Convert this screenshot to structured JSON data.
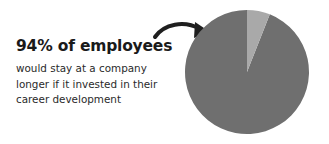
{
  "headline": "94% of employees",
  "body_lines": [
    "would stay at a company",
    "longer if it invested in their",
    "career development"
  ],
  "colors": {
    "major_slice": "#6f6f6f",
    "minor_slice": "#a9a9a9",
    "arrow": "#1f1f1f"
  },
  "chart_data": {
    "type": "pie",
    "title": "",
    "categories": [
      "Would stay longer",
      "Other"
    ],
    "values": [
      94,
      6
    ],
    "unit": "%",
    "annotations": [
      "94% of employees would stay at a company longer if it invested in their career development"
    ]
  }
}
